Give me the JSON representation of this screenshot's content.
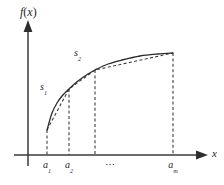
{
  "figure": {
    "background_color": "#ffffff",
    "line_color": "#2b2b2b",
    "axis_color": "#3a3a3a",
    "axis_labels": {
      "y_function": "f",
      "y_paren_open": "(",
      "y_variable": "x",
      "y_paren_close": ")",
      "x_axis": "x"
    },
    "region_labels": [
      {
        "base": "s",
        "sub": "1"
      },
      {
        "base": "s",
        "sub": "2"
      }
    ],
    "tick_labels": [
      {
        "base": "a",
        "sub": "1"
      },
      {
        "base": "a",
        "sub": "2"
      },
      {
        "base": "⋯",
        "sub": ""
      },
      {
        "base": "a",
        "sub": "m"
      }
    ]
  },
  "chart_data": {
    "type": "line",
    "title": "",
    "xlabel": "x",
    "ylabel": "f(x)",
    "grid": false,
    "legend": null,
    "xlim": [
      28,
      207
    ],
    "ylim": [
      155,
      25
    ],
    "partition_x": [
      47,
      69,
      95,
      173
    ],
    "series": [
      {
        "name": "f(x) solid curve",
        "style": "solid",
        "points": [
          [
            47,
            130
          ],
          [
            52,
            113
          ],
          [
            57,
            103
          ],
          [
            62,
            96
          ],
          [
            69,
            89
          ],
          [
            78,
            81
          ],
          [
            88,
            74
          ],
          [
            95,
            70
          ],
          [
            108,
            64
          ],
          [
            122,
            60
          ],
          [
            140,
            56
          ],
          [
            158,
            54
          ],
          [
            173,
            53
          ]
        ]
      },
      {
        "name": "inscribed chord polyline",
        "style": "dashed",
        "points": [
          [
            47,
            130
          ],
          [
            69,
            89
          ],
          [
            95,
            70
          ],
          [
            173,
            53
          ]
        ]
      }
    ],
    "drop_lines": [
      {
        "x": 47,
        "y_top": 130,
        "y_bottom": 155
      },
      {
        "x": 69,
        "y_top": 89,
        "y_bottom": 155
      },
      {
        "x": 95,
        "y_top": 70,
        "y_bottom": 155
      },
      {
        "x": 173,
        "y_top": 53,
        "y_bottom": 155
      }
    ],
    "annotations": [
      {
        "text": "s1",
        "x": 44,
        "y": 87
      },
      {
        "text": "s2",
        "x": 78,
        "y": 53
      }
    ]
  }
}
